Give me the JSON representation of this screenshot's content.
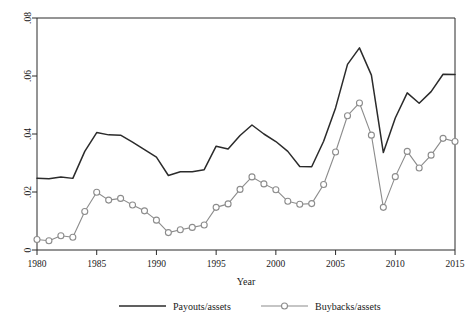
{
  "chart_data": {
    "type": "line",
    "title": "",
    "xlabel": "Year",
    "ylabel": "",
    "xlim": [
      1980,
      2015
    ],
    "ylim": [
      0,
      0.08
    ],
    "grid": false,
    "legend_position": "bottom",
    "xticks": [
      "1980",
      "1985",
      "1990",
      "1995",
      "2000",
      "2005",
      "2010",
      "2015"
    ],
    "xtick_values": [
      1980,
      1985,
      1990,
      1995,
      2000,
      2005,
      2010,
      2015
    ],
    "yticks": [
      "0",
      ".02",
      ".04",
      ".06",
      ".08"
    ],
    "ytick_values": [
      0,
      0.02,
      0.04,
      0.06,
      0.08
    ],
    "x": [
      1980,
      1981,
      1982,
      1983,
      1984,
      1985,
      1986,
      1987,
      1988,
      1989,
      1990,
      1991,
      1992,
      1993,
      1994,
      1995,
      1996,
      1997,
      1998,
      1999,
      2000,
      2001,
      2002,
      2003,
      2004,
      2005,
      2006,
      2007,
      2008,
      2009,
      2010,
      2011,
      2012,
      2013,
      2014,
      2015
    ],
    "series": [
      {
        "name": "Payouts/assets",
        "color": "#2b2b2b",
        "marker": "none",
        "values": [
          0.0247,
          0.0246,
          0.0252,
          0.0247,
          0.034,
          0.0405,
          0.0397,
          0.0396,
          0.0372,
          0.0346,
          0.032,
          0.0257,
          0.027,
          0.027,
          0.0277,
          0.0358,
          0.0348,
          0.0395,
          0.0431,
          0.04,
          0.0374,
          0.034,
          0.0288,
          0.0287,
          0.0375,
          0.049,
          0.064,
          0.0697,
          0.0603,
          0.0336,
          0.0455,
          0.0542,
          0.0506,
          0.0546,
          0.0606,
          0.0605
        ]
      },
      {
        "name": "Buybacks/assets",
        "color": "#8c8c8c",
        "marker": "circle",
        "values": [
          0.0036,
          0.0032,
          0.0049,
          0.0044,
          0.0133,
          0.0199,
          0.0172,
          0.0178,
          0.0155,
          0.0135,
          0.0103,
          0.006,
          0.007,
          0.0078,
          0.0086,
          0.0147,
          0.0159,
          0.0209,
          0.0252,
          0.0228,
          0.0208,
          0.0168,
          0.0158,
          0.016,
          0.0226,
          0.0338,
          0.0463,
          0.0507,
          0.0396,
          0.0147,
          0.0253,
          0.034,
          0.0283,
          0.0327,
          0.0385,
          0.0374
        ]
      }
    ]
  },
  "legend": {
    "entries": [
      {
        "label": "Payouts/assets"
      },
      {
        "label": "Buybacks/assets"
      }
    ]
  }
}
